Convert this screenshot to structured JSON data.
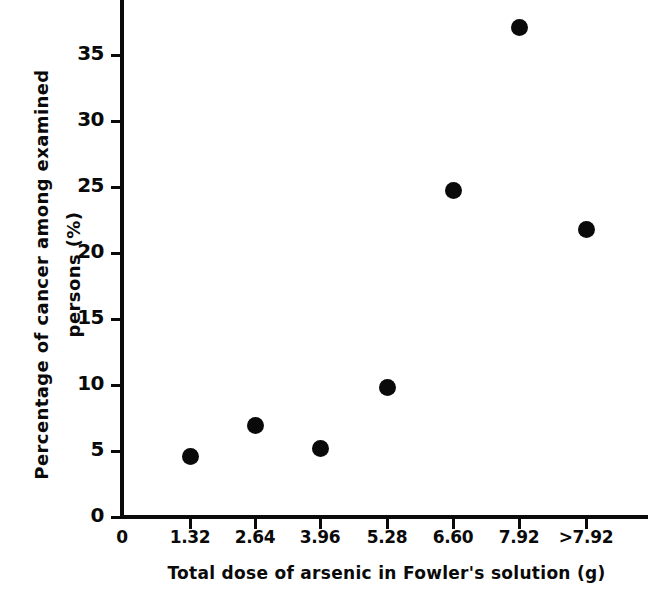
{
  "chart_data": {
    "type": "scatter",
    "title": "",
    "xlabel": "Total dose of arsenic in Fowler's solution (g)",
    "ylabel_line1": "Percentage of cancer among examined",
    "ylabel_line2": "persons (%)",
    "categories": [
      "1.32",
      "2.64",
      "3.96",
      "5.28",
      "6.60",
      "7.92",
      ">7.92"
    ],
    "values": [
      4.6,
      6.9,
      5.2,
      9.8,
      24.7,
      37.1,
      21.8
    ],
    "x_tick_labels": [
      "0",
      "1.32",
      "2.64",
      "3.96",
      "5.28",
      "6.60",
      "7.92",
      ">7.92"
    ],
    "y_tick_labels": [
      "0",
      "5",
      "10",
      "15",
      "20",
      "25",
      "30",
      "35"
    ],
    "y_ticks": [
      0,
      5,
      10,
      15,
      20,
      25,
      30,
      35
    ],
    "ylim": [
      0,
      38.5
    ],
    "grid": false,
    "legend": "none",
    "marker": "filled-circle",
    "marker_color": "#0a0a0a",
    "points": [
      {
        "x_label": "1.32",
        "value": 4.6
      },
      {
        "x_label": "2.64",
        "value": 6.9
      },
      {
        "x_label": "3.96",
        "value": 5.2
      },
      {
        "x_label": "5.28",
        "value": 9.8
      },
      {
        "x_label": "6.60",
        "value": 24.7
      },
      {
        "x_label": "7.92",
        "value": 37.1
      },
      {
        "x_label": ">7.92",
        "value": 21.8
      }
    ]
  }
}
